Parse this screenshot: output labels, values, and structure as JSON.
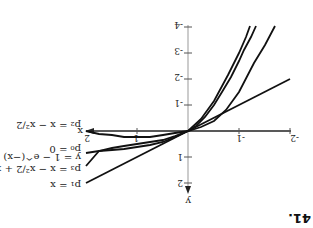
{
  "figure": {
    "number": "41.",
    "orientation": "rotated 180 degrees",
    "axes": {
      "x_label": "x",
      "y_label": "y",
      "x_ticks": [
        "-2",
        "-1",
        "1",
        "2"
      ],
      "y_ticks": [
        "-4",
        "-3",
        "-2",
        "-1",
        "1",
        "2"
      ]
    },
    "curves": [
      {
        "id": "f",
        "label": "y = 1 − e^(−x)"
      },
      {
        "id": "p0",
        "label": "p₀ = 0"
      },
      {
        "id": "p1",
        "label": "p₁ = x"
      },
      {
        "id": "p2",
        "label": "p₂ = x − x²/2"
      },
      {
        "id": "p3",
        "label": "p₃ = x − x²/2 + x³/6"
      }
    ]
  }
}
